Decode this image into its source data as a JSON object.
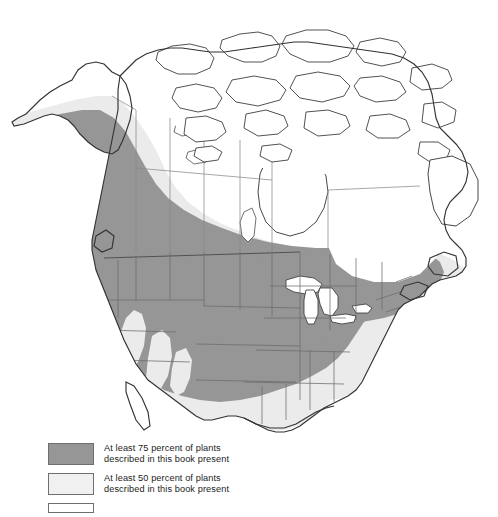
{
  "figure": {
    "kind": "distribution-map",
    "region": "North America",
    "background_color": "#ffffff",
    "coastline_color": "#333333",
    "internal_border_color": "#6b6b6b"
  },
  "zones": [
    {
      "id": "zone-75",
      "label": "At least 75 percent of plants described in this book present",
      "fill": "#969696",
      "coverage_percent": 75
    },
    {
      "id": "zone-50",
      "label": "At least 50 percent of plants described in this book present",
      "fill": "#ebebeb",
      "coverage_percent": 50
    }
  ],
  "legend": {
    "items": [
      {
        "swatch_color": "#969696",
        "line1": "At least 75 percent of plants",
        "line2": "described in this book present",
        "text": "At least 75 percent of plants\ndescribed in this book present"
      },
      {
        "swatch_color": "#f0f0f0",
        "line1": "At least 50 percent of plants",
        "line2": "described in this book present",
        "text": "At least 50 percent of plants\ndescribed in this book present"
      },
      {
        "swatch_color": "#ffffff",
        "line1": "",
        "line2": "",
        "text": "",
        "clipped": true
      }
    ]
  }
}
